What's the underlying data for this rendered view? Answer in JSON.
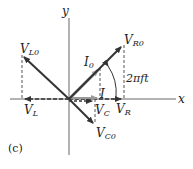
{
  "figure": {
    "panel_label": "(c)",
    "axes": {
      "x_label": "x",
      "y_label": "y"
    },
    "phasors": {
      "VR0": {
        "main": "V",
        "sub": "R0"
      },
      "VL0": {
        "main": "V",
        "sub": "L0"
      },
      "VC0": {
        "main": "V",
        "sub": "C0"
      },
      "I0": {
        "main": "I",
        "sub": "0"
      }
    },
    "projections": {
      "VR": {
        "main": "V",
        "sub": "R"
      },
      "VL": {
        "main": "V",
        "sub": "L"
      },
      "VC": {
        "main": "V",
        "sub": "C"
      },
      "I": {
        "main": "I"
      }
    },
    "angle_label": "2πft",
    "colors": {
      "axis": "#555555",
      "phasor": "#333333",
      "current": "#999999",
      "dashed": "#555555"
    }
  }
}
